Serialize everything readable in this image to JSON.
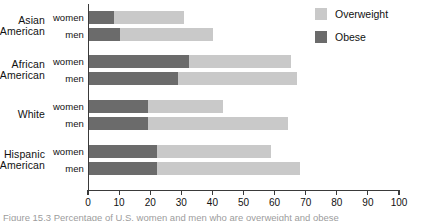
{
  "chart_data": {
    "type": "bar",
    "orientation": "horizontal",
    "stacked": true,
    "title": "",
    "xlabel": "",
    "ylabel": "",
    "xlim": [
      0,
      100
    ],
    "xticks": [
      0,
      10,
      20,
      30,
      40,
      50,
      60,
      70,
      80,
      90,
      100
    ],
    "xtick_labels": [
      "0",
      "10",
      "20",
      "30",
      "40",
      "50",
      "60",
      "70",
      "80",
      "90",
      "100"
    ],
    "grid": false,
    "legend_position": "top-right",
    "legend": [
      "Overweight",
      "Obese"
    ],
    "colors": {
      "overweight": "#c9c9c9",
      "obese": "#6b6b6b",
      "axis": "#3a3a3a",
      "text": "#111111"
    },
    "groups": [
      "Asian American",
      "African American",
      "White",
      "Hispanic American"
    ],
    "categories": [
      "Asian American women",
      "Asian American men",
      "African American women",
      "African American men",
      "White women",
      "White men",
      "Hispanic American women",
      "Hispanic American men"
    ],
    "series": [
      {
        "name": "Obese",
        "values": [
          8,
          10,
          32,
          28.5,
          19,
          19,
          22,
          22
        ]
      },
      {
        "name": "Overweight",
        "values": [
          22.5,
          30,
          33,
          38.5,
          24,
          45,
          36.5,
          46
        ]
      }
    ],
    "totals": [
      30.5,
      40,
      65,
      67,
      43,
      64,
      58.5,
      68
    ]
  },
  "groups": [
    {
      "name": "Asian American",
      "line1": "Asian",
      "line2": "American",
      "rows": [
        {
          "label": "women",
          "obese": 8,
          "overweight": 22.5,
          "total": 30.5
        },
        {
          "label": "men",
          "obese": 10,
          "overweight": 30,
          "total": 40
        }
      ]
    },
    {
      "name": "African American",
      "line1": "African",
      "line2": "American",
      "rows": [
        {
          "label": "women",
          "obese": 32,
          "overweight": 33,
          "total": 65
        },
        {
          "label": "men",
          "obese": 28.5,
          "overweight": 38.5,
          "total": 67
        }
      ]
    },
    {
      "name": "White",
      "line1": "White",
      "line2": "",
      "rows": [
        {
          "label": "women",
          "obese": 19,
          "overweight": 24,
          "total": 43
        },
        {
          "label": "men",
          "obese": 19,
          "overweight": 45,
          "total": 64
        }
      ]
    },
    {
      "name": "Hispanic American",
      "line1": "Hispanic",
      "line2": "American",
      "rows": [
        {
          "label": "women",
          "obese": 22,
          "overweight": 36.5,
          "total": 58.5
        },
        {
          "label": "men",
          "obese": 22,
          "overweight": 46,
          "total": 68
        }
      ]
    }
  ],
  "legend": {
    "items": [
      {
        "key": "overweight",
        "label": "Overweight"
      },
      {
        "key": "obese",
        "label": "Obese"
      }
    ]
  },
  "axis": {
    "min": 0,
    "max": 100,
    "ticks": [
      "0",
      "10",
      "20",
      "30",
      "40",
      "50",
      "60",
      "70",
      "80",
      "90",
      "100"
    ]
  },
  "caption": {
    "text": "Figure 15.3 Percentage of U.S. women and men who are overweight and obese"
  }
}
